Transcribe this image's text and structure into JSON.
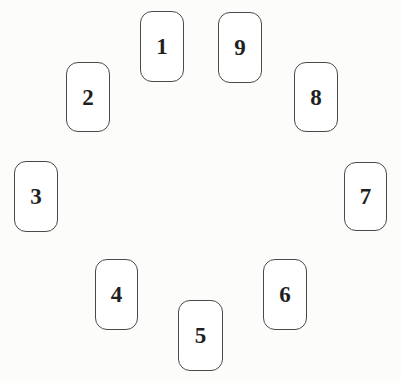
{
  "spread": {
    "cards": [
      {
        "id": 1,
        "label": "1"
      },
      {
        "id": 2,
        "label": "2"
      },
      {
        "id": 3,
        "label": "3"
      },
      {
        "id": 4,
        "label": "4"
      },
      {
        "id": 5,
        "label": "5"
      },
      {
        "id": 6,
        "label": "6"
      },
      {
        "id": 7,
        "label": "7"
      },
      {
        "id": 8,
        "label": "8"
      },
      {
        "id": 9,
        "label": "9"
      }
    ]
  },
  "colors": {
    "page_background": "#fcfcfb",
    "card_background": "#ffffff",
    "card_border": "#4a4a4a",
    "number_text": "#1f1f1f"
  }
}
